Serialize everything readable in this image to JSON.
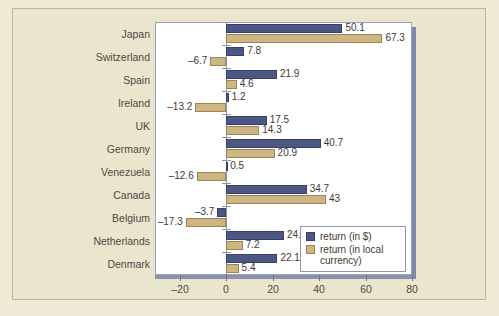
{
  "chart_data": {
    "type": "bar",
    "orientation": "horizontal",
    "title": "",
    "xlabel": "",
    "ylabel": "",
    "xlim": [
      -27,
      80
    ],
    "xticks": [
      -20,
      0,
      20,
      40,
      60,
      80
    ],
    "xtick_labels": [
      "–20",
      "0",
      "20",
      "40",
      "60",
      "80"
    ],
    "grid": false,
    "legend_position": "bottom-right",
    "categories": [
      "Japan",
      "Switzerland",
      "Spain",
      "Ireland",
      "UK",
      "Germany",
      "Venezuela",
      "Canada",
      "Belgium",
      "Netherlands",
      "Denmark"
    ],
    "series": [
      {
        "name": "return (in $)",
        "color": "#4c5783",
        "values": [
          50.1,
          7.8,
          21.9,
          1.2,
          17.5,
          40.7,
          0.5,
          34.7,
          -3.7,
          24.9,
          22.1
        ],
        "labels": [
          "50.1",
          "7.8",
          "21.9",
          "1.2",
          "17.5",
          "40.7",
          "0.5",
          "34.7",
          "–3.7",
          "24.9",
          "22.1"
        ]
      },
      {
        "name": "return (in local currency)",
        "color": "#cdb584",
        "values": [
          67.3,
          -6.7,
          4.6,
          -13.2,
          14.3,
          20.9,
          -12.6,
          43,
          -17.3,
          7.2,
          5.4
        ],
        "labels": [
          "67.3",
          "–6.7",
          "4.6",
          "–13.2",
          "14.3",
          "20.9",
          "–12.6",
          "43",
          "–17.3",
          "7.2",
          "5.4"
        ]
      }
    ],
    "legend": [
      {
        "label": "return (in $)",
        "color": "#4c5783"
      },
      {
        "label": "return (in local currency)",
        "color": "#cdb584"
      }
    ]
  },
  "legend": {
    "dollar_label": "return (in $)",
    "local_label_line1": "return (in local",
    "local_label_line2": "currency)"
  },
  "colors": {
    "page_background": "#ece5ce",
    "plot_background": "#ffffff",
    "series_dollar": "#4c5783",
    "series_local": "#cdb584",
    "axis": "#8f98ad",
    "text": "#4c4a42"
  }
}
